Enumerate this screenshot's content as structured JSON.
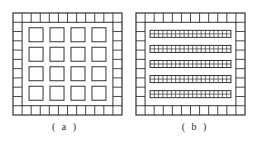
{
  "figure": {
    "panels": [
      {
        "id": "a",
        "caption": "( a )",
        "frame": {
          "x": 13,
          "y": 13,
          "width": 109,
          "height": 102,
          "ring_cells_x": 12,
          "ring_cells_y": 11
        },
        "interior": {
          "type": "square-array",
          "rows": 4,
          "cols": 4
        }
      },
      {
        "id": "b",
        "caption": "( b )",
        "frame": {
          "x": 6,
          "y": 13,
          "width": 109,
          "height": 102,
          "ring_cells_x": 12,
          "ring_cells_y": 11
        },
        "interior": {
          "type": "strip-array",
          "strips": 5,
          "strip_cells_cols": 19,
          "strip_cells_rows": 2
        }
      }
    ],
    "colors": {
      "line": "#333333",
      "background": "#ffffff"
    }
  }
}
